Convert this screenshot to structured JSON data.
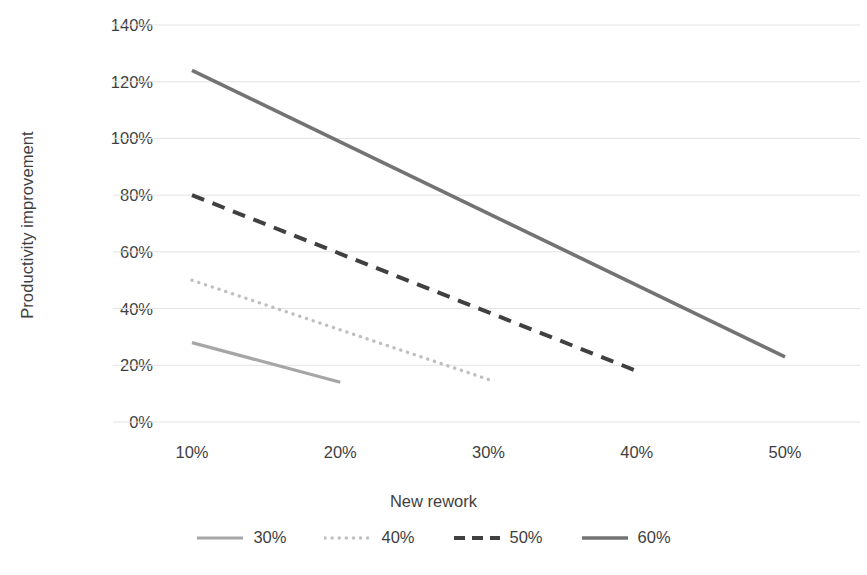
{
  "chart_data": {
    "type": "line",
    "title": "",
    "xlabel": "New rework",
    "ylabel": "Productivity improvement",
    "x_tick_labels": [
      "10%",
      "20%",
      "30%",
      "40%",
      "50%"
    ],
    "x_tick_values": [
      10,
      20,
      30,
      40,
      50
    ],
    "y_tick_labels": [
      "0%",
      "20%",
      "40%",
      "60%",
      "80%",
      "100%",
      "120%",
      "140%"
    ],
    "y_tick_values": [
      0,
      20,
      40,
      60,
      80,
      100,
      120,
      140
    ],
    "ylim": [
      0,
      140
    ],
    "xlim": [
      10,
      50
    ],
    "grid": "horizontal",
    "legend_position": "bottom",
    "series": [
      {
        "name": "30%",
        "style": "solid",
        "color": "#a6a6a6",
        "width": 3.2,
        "x": [
          10,
          20
        ],
        "values": [
          28,
          14
        ]
      },
      {
        "name": "40%",
        "style": "dotted",
        "color": "#bfbfbf",
        "width": 3.4,
        "x": [
          10,
          30
        ],
        "values": [
          50,
          15
        ]
      },
      {
        "name": "50%",
        "style": "dashed",
        "color": "#404040",
        "width": 4.0,
        "x": [
          10,
          40
        ],
        "values": [
          80,
          18
        ]
      },
      {
        "name": "60%",
        "style": "solid",
        "color": "#737373",
        "width": 3.6,
        "x": [
          10,
          50
        ],
        "values": [
          124,
          23
        ]
      }
    ]
  },
  "colors": {
    "background": "#ffffff",
    "gridline": "#e3e3e3",
    "text": "#3f3f3f"
  },
  "legend": {
    "items": [
      {
        "label": "30%"
      },
      {
        "label": "40%"
      },
      {
        "label": "50%"
      },
      {
        "label": "60%"
      }
    ]
  }
}
